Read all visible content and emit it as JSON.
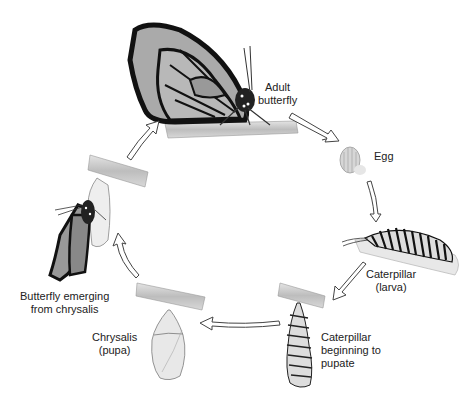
{
  "diagram": {
    "stages": [
      {
        "id": "adult",
        "label_line1": "Adult",
        "label_line2": "butterfly"
      },
      {
        "id": "egg",
        "label_line1": "Egg"
      },
      {
        "id": "larva",
        "label_line1": "Caterpillar",
        "label_line2": "(larva)"
      },
      {
        "id": "prepupa",
        "label_line1": "Caterpillar",
        "label_line2": "beginning to",
        "label_line3": "pupate"
      },
      {
        "id": "pupa",
        "label_line1": "Chrysalis",
        "label_line2": "(pupa)"
      },
      {
        "id": "emerging",
        "label_line1": "Butterfly emerging",
        "label_line2": "from chrysalis"
      }
    ],
    "flow": [
      "adult",
      "egg",
      "larva",
      "prepupa",
      "pupa",
      "emerging",
      "adult"
    ],
    "colors": {
      "line": "#1a1a1a",
      "wing": "#b0b0b0",
      "branch": "#c8c8c8",
      "background": "#ffffff"
    }
  }
}
